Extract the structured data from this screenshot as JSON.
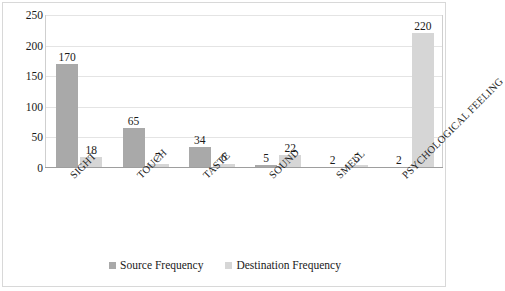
{
  "chart_data": {
    "type": "bar",
    "title": "",
    "subtitle": "",
    "xlabel": "",
    "ylabel": "",
    "ylim": [
      0,
      250
    ],
    "yticks": [
      "0",
      "50",
      "100",
      "150",
      "200",
      "250"
    ],
    "grid": true,
    "legend_position": "bottom",
    "categories": [
      "SIGHT",
      "TOUCH",
      "TASTE",
      "SOUND",
      "SMELL",
      "PSYCHOLOGICAL FEELING"
    ],
    "series": [
      {
        "name": "Source Frequency",
        "color": "#a9a9a9",
        "values": [
          170,
          65,
          34,
          5,
          2,
          2
        ]
      },
      {
        "name": "Destination Frequency",
        "color": "#d6d6d6",
        "values": [
          18,
          7,
          6,
          22,
          5,
          220
        ]
      }
    ],
    "data_labels": [
      [
        "170",
        "18"
      ],
      [
        "65",
        "7"
      ],
      [
        "34",
        "6"
      ],
      [
        "5",
        "22"
      ],
      [
        "2",
        "5"
      ],
      [
        "2",
        "220"
      ]
    ]
  },
  "legend": {
    "items": [
      {
        "label": "Source Frequency",
        "color": "#a9a9a9"
      },
      {
        "label": "Destination Frequency",
        "color": "#d6d6d6"
      }
    ]
  },
  "axis": {
    "y_ticks": [
      "250",
      "200",
      "150",
      "100",
      "50",
      "0"
    ]
  }
}
